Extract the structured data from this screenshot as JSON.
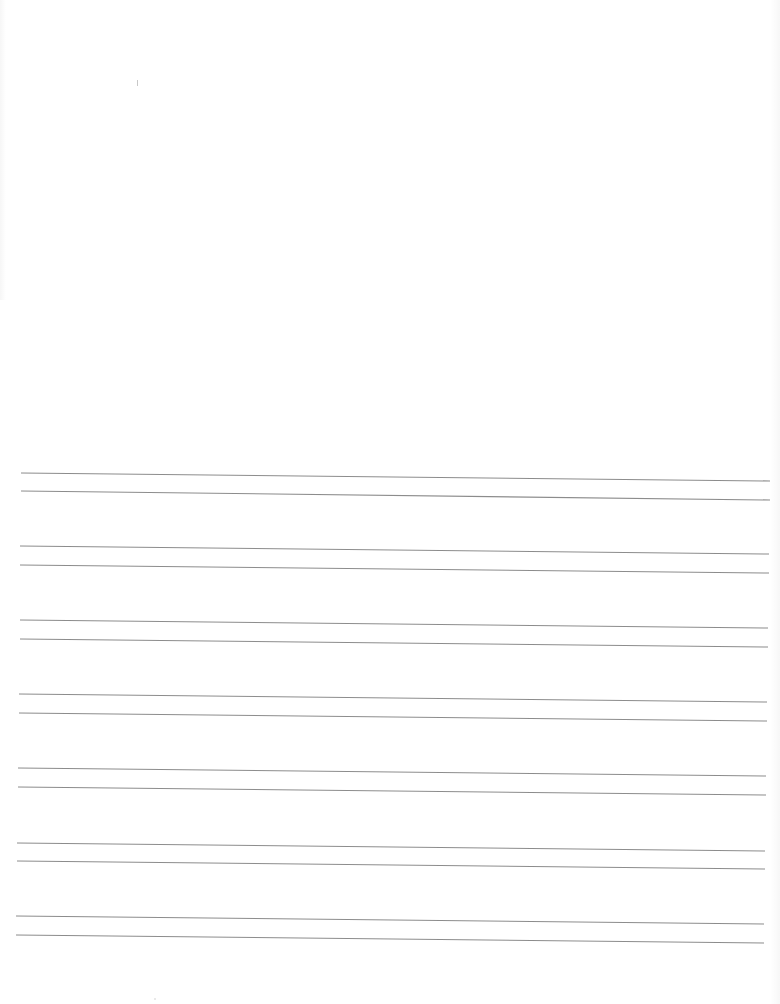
{
  "page": {
    "type": "blank lined writing sheet",
    "background": "#ffffff",
    "line_color": "#8c8c8c",
    "line_pairs": [
      {
        "top": {
          "x1": 21,
          "y1": 473,
          "x2": 770,
          "y2": 481
        },
        "bottom": {
          "x1": 21,
          "y1": 491,
          "x2": 770,
          "y2": 500
        }
      },
      {
        "top": {
          "x1": 20,
          "y1": 546,
          "x2": 769,
          "y2": 554
        },
        "bottom": {
          "x1": 20,
          "y1": 565,
          "x2": 769,
          "y2": 573
        }
      },
      {
        "top": {
          "x1": 20,
          "y1": 620,
          "x2": 768,
          "y2": 628
        },
        "bottom": {
          "x1": 20,
          "y1": 639,
          "x2": 768,
          "y2": 647
        }
      },
      {
        "top": {
          "x1": 19,
          "y1": 694,
          "x2": 767,
          "y2": 702
        },
        "bottom": {
          "x1": 19,
          "y1": 713,
          "x2": 767,
          "y2": 721
        }
      },
      {
        "top": {
          "x1": 18,
          "y1": 768,
          "x2": 766,
          "y2": 776
        },
        "bottom": {
          "x1": 18,
          "y1": 787,
          "x2": 766,
          "y2": 795
        }
      },
      {
        "top": {
          "x1": 17,
          "y1": 843,
          "x2": 765,
          "y2": 851
        },
        "bottom": {
          "x1": 17,
          "y1": 861,
          "x2": 765,
          "y2": 869
        }
      },
      {
        "top": {
          "x1": 16,
          "y1": 916,
          "x2": 764,
          "y2": 924
        },
        "bottom": {
          "x1": 16,
          "y1": 935,
          "x2": 764,
          "y2": 943
        }
      }
    ],
    "marks": [
      {
        "x": 137,
        "y": 80,
        "kind": "faint-speck"
      },
      {
        "x": 154,
        "y": 998,
        "kind": "faint-dot"
      }
    ]
  }
}
